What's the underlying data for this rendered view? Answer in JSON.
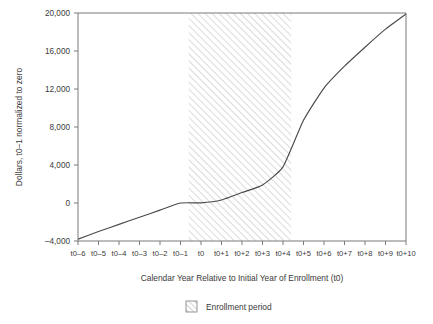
{
  "chart_data": {
    "type": "line",
    "title": "",
    "subtitle": "",
    "xlabel": "Calendar Year Relative to Initial Year of Enrollment (t0)",
    "ylabel": "Dollars, t0–1 normalized to zero",
    "categories": [
      "t0–6",
      "t0–5",
      "t0–4",
      "t0–3",
      "t0–2",
      "t0–1",
      "t0",
      "t0+1",
      "t0+2",
      "t0+3",
      "t0+4",
      "t0+5",
      "t0+6",
      "t0+7",
      "t0+8",
      "t0+9",
      "t0+10"
    ],
    "values": [
      -3800,
      -3000,
      -2250,
      -1500,
      -750,
      0,
      20,
      320,
      1100,
      1900,
      3800,
      8700,
      12100,
      14400,
      16400,
      18300,
      19900
    ],
    "series": [
      {
        "name": "Cumulative dollars",
        "values": [
          -3800,
          -3000,
          -2250,
          -1500,
          -750,
          0,
          20,
          320,
          1100,
          1900,
          3800,
          8700,
          12100,
          14400,
          16400,
          18300,
          19900
        ]
      }
    ],
    "ylim": [
      -4000,
      20000
    ],
    "xlim": [
      "t0–6",
      "t0+10"
    ],
    "ytick_labels": [
      "20,000",
      "16,000",
      "12,000",
      "8,000",
      "4,000",
      "0",
      "–4,000"
    ],
    "ytick_values": [
      20000,
      16000,
      12000,
      8000,
      4000,
      0,
      -4000
    ],
    "grid": false,
    "legend_position": "bottom-center",
    "line_color": "#4a4a4a",
    "axis_color": "#6e6e6e",
    "hatch_color": "#b4b4b4",
    "shaded_regions": [
      {
        "label": "Enrollment period",
        "x_start": "t0–0.6",
        "x_end": "t0+4.4",
        "style": "diagonal-hatch"
      }
    ],
    "legend": [
      {
        "label": "Enrollment period",
        "swatch": "diagonal-hatch"
      }
    ]
  },
  "figure": {
    "legend_entry_label": "Enrollment period"
  }
}
